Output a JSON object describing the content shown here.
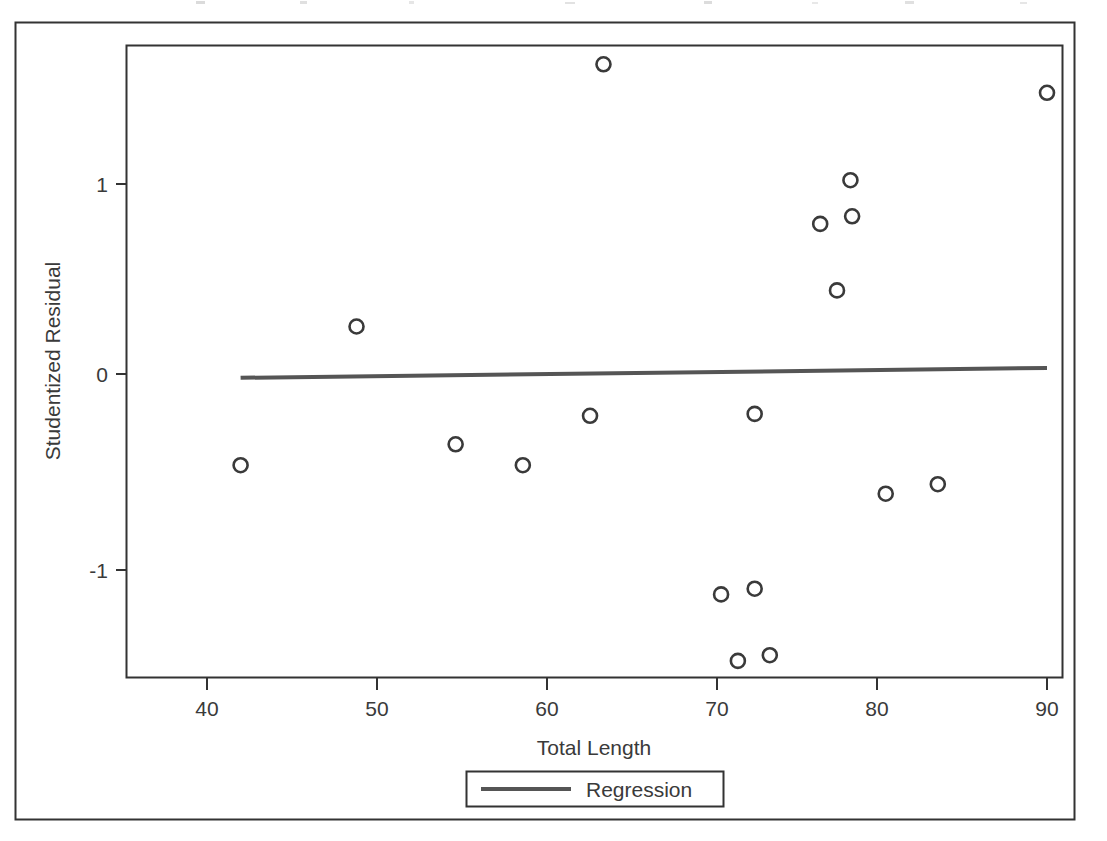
{
  "figure": {
    "outer_border": true,
    "background_color": "#ffffff",
    "line_color": "#555555",
    "axis_color": "#333333",
    "text_color": "#3a3a3a"
  },
  "chart_data": {
    "type": "scatter",
    "title": "",
    "subtitle": "",
    "xlabel": "Total Length",
    "ylabel": "Studentized Residual",
    "xlim": [
      35.5,
      91.5
    ],
    "ylim": [
      -1.72,
      1.74
    ],
    "xticks": [
      40,
      50,
      60,
      70,
      80,
      90
    ],
    "xtick_labels": [
      "40",
      "50",
      "60",
      "70",
      "80",
      "90"
    ],
    "yticks": [
      1,
      0,
      -1
    ],
    "ytick_labels": [
      "1",
      "0",
      "-1"
    ],
    "grid": false,
    "legend_position": "below-axes",
    "marker": "open-circle",
    "marker_color": "#3a3a3a",
    "series": [
      {
        "name": "Observations",
        "x": [
          42.0,
          48.9,
          54.8,
          58.8,
          62.8,
          63.6,
          70.6,
          71.6,
          72.6,
          72.6,
          73.5,
          76.5,
          77.5,
          78.3,
          78.4,
          80.4,
          83.5,
          90.0
        ],
        "y": [
          -0.48,
          0.25,
          -0.37,
          -0.48,
          -0.22,
          1.63,
          -1.16,
          -1.51,
          -1.13,
          -0.21,
          -1.48,
          0.79,
          0.44,
          1.02,
          0.83,
          -0.63,
          -0.58,
          1.48
        ]
      },
      {
        "name": "Regression",
        "type": "line",
        "x": [
          42.0,
          90.0
        ],
        "y": [
          -0.02,
          0.032
        ]
      }
    ],
    "extra_points": {
      "note": "point at x=48.9 y=1.63 sits at top of axes"
    },
    "legend": [
      {
        "label": "Regression",
        "marker": "line",
        "color": "#555555"
      }
    ]
  }
}
